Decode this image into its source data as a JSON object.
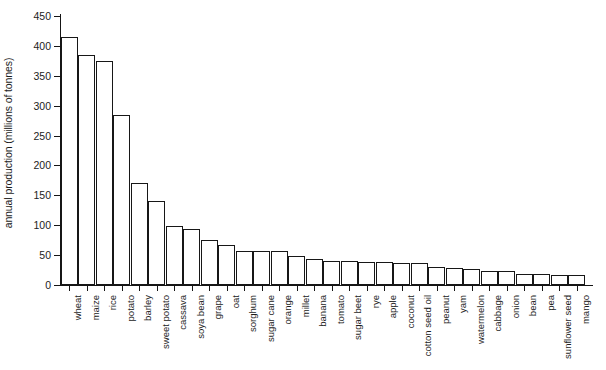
{
  "chart_data": {
    "type": "bar",
    "title": "",
    "xlabel": "",
    "ylabel": "annual production (millions of tonnes)",
    "ylim": [
      0,
      450
    ],
    "yticks": [
      0,
      50,
      100,
      150,
      200,
      250,
      300,
      350,
      400,
      450
    ],
    "grid": false,
    "legend": null,
    "categories": [
      "wheat",
      "maize",
      "rice",
      "potato",
      "barley",
      "sweet potato",
      "cassava",
      "soya bean",
      "grape",
      "oat",
      "sorghum",
      "sugar cane",
      "orange",
      "millet",
      "banana",
      "tomato",
      "sugar beet",
      "rye",
      "apple",
      "coconut",
      "cotton seed oil",
      "peanut",
      "yam",
      "watermelon",
      "cabbage",
      "onion",
      "bean",
      "pea",
      "sunflower seed",
      "mango"
    ],
    "values": [
      415,
      385,
      374,
      285,
      170,
      140,
      98,
      93,
      76,
      67,
      57,
      57,
      57,
      48,
      43,
      40,
      40,
      39,
      38,
      37,
      36,
      30,
      28,
      26,
      24,
      23,
      19,
      18,
      17,
      16
    ]
  },
  "axis": {
    "y_title": "annual production (millions of tonnes)",
    "tick_labels": [
      "0",
      "50",
      "100",
      "150",
      "200",
      "250",
      "300",
      "350",
      "400",
      "450"
    ]
  }
}
